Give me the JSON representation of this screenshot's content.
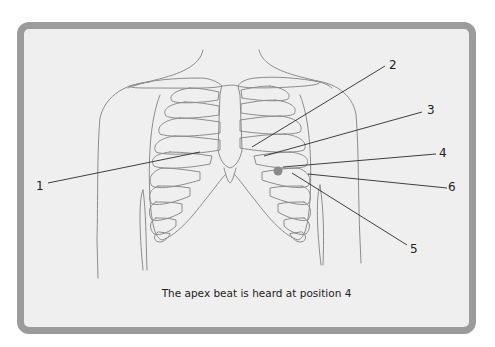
{
  "figure": {
    "caption": "The apex beat is heard at position 4",
    "labels": [
      {
        "id": "1",
        "text": "1"
      },
      {
        "id": "2",
        "text": "2"
      },
      {
        "id": "3",
        "text": "3"
      },
      {
        "id": "4",
        "text": "4"
      },
      {
        "id": "5",
        "text": "5"
      },
      {
        "id": "6",
        "text": "6"
      }
    ],
    "marker": {
      "position": "4",
      "color": "#8a8a8a"
    },
    "colors": {
      "frame_border": "#9b9b9b",
      "frame_background": "#efefef",
      "outline": "#8c8c8c",
      "leader_line": "#2a2a2a"
    }
  }
}
